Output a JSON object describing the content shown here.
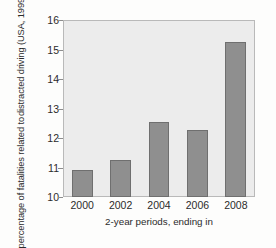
{
  "chart_data": {
    "type": "bar",
    "title": "",
    "categories": [
      "2000",
      "2002",
      "2004",
      "2006",
      "2008"
    ],
    "values": [
      10.93,
      11.25,
      12.55,
      12.27,
      15.25
    ],
    "xlabel": "2-year periods, ending in",
    "ylabel_line1": "percentage of fatalities related to",
    "ylabel_line2": "distracted driving (USA, 1999–2008)",
    "ylim": [
      10,
      16
    ],
    "yticks": [
      10,
      11,
      12,
      13,
      14,
      15,
      16
    ],
    "ytick_labels": [
      "10",
      "11",
      "12",
      "13",
      "14",
      "15",
      "16"
    ],
    "grid": false,
    "legend": "none",
    "bar_color": "#8f8f8f",
    "bar_edge_color": "#6f6f6f",
    "plot_background": "#ececec",
    "page_background": "#fdfdfc"
  }
}
